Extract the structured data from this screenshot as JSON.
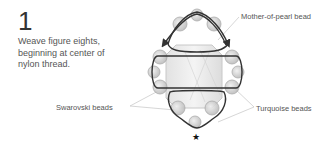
{
  "step": {
    "number": "1",
    "instruction": "Weave figure eights, beginning at center of nylon thread."
  },
  "labels": {
    "mother_of_pearl": "Mother-of-pearl bead",
    "swarovski": "Swarovski beads",
    "turquoise": "Turquoise beads"
  },
  "markers": {
    "start_marker": "★"
  },
  "colors": {
    "thread": "#333333",
    "bead_fill": "#d8d8d8",
    "bead_stroke": "#999999",
    "center_bead": "#e6e6e6",
    "leader": "#bbbbbb"
  }
}
